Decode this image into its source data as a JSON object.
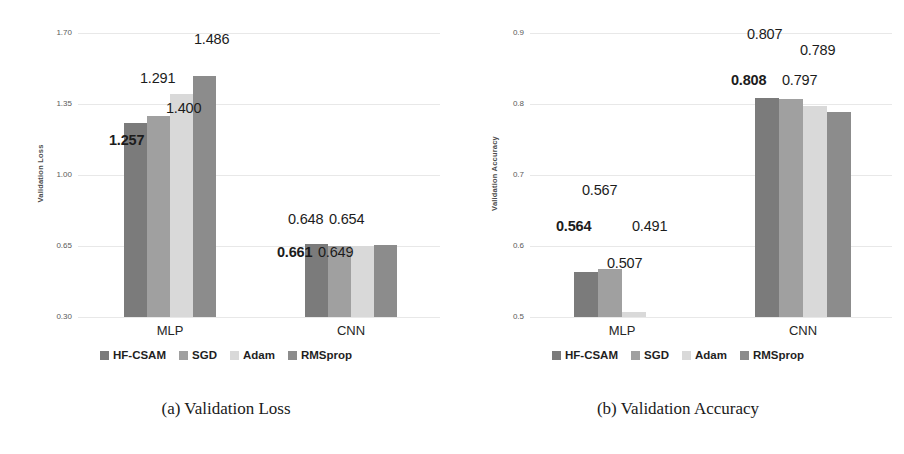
{
  "figure": {
    "series_colors": [
      "#7b7b7b",
      "#a0a0a0",
      "#d9d9d9",
      "#8c8c8c"
    ],
    "legend": [
      {
        "label": "HF-CSAM",
        "color": "#7b7b7b",
        "swatch_name": "legend-swatch-hf-csam"
      },
      {
        "label": "SGD",
        "color": "#a0a0a0",
        "swatch_name": "legend-swatch-sgd"
      },
      {
        "label": "Adam",
        "color": "#d9d9d9",
        "swatch_name": "legend-swatch-adam"
      },
      {
        "label": "RMSprop",
        "color": "#8c8c8c",
        "swatch_name": "legend-swatch-rmsprop"
      }
    ]
  },
  "panel_a": {
    "caption": "(a) Validation Loss",
    "chart_data": {
      "type": "bar",
      "title": "",
      "xlabel": "",
      "ylabel": "Validation Loss",
      "ylim": [
        0.3,
        1.7
      ],
      "yticks": [
        "0.30",
        "0.65",
        "1.00",
        "1.35",
        "1.70"
      ],
      "ytick_values": [
        0.3,
        0.65,
        1.0,
        1.35,
        1.7
      ],
      "grid": true,
      "legend_position": "bottom",
      "categories": [
        "MLP",
        "CNN"
      ],
      "series": [
        {
          "name": "HF-CSAM",
          "values": [
            1.257,
            0.661
          ],
          "labels": [
            "1.257",
            "0.661"
          ]
        },
        {
          "name": "SGD",
          "values": [
            1.291,
            0.648
          ],
          "labels": [
            "1.291",
            "0.648"
          ]
        },
        {
          "name": "Adam",
          "values": [
            1.4,
            0.649
          ],
          "labels": [
            "1.400",
            "0.649"
          ]
        },
        {
          "name": "RMSprop",
          "values": [
            1.486,
            0.654
          ],
          "labels": [
            "1.486",
            "0.654"
          ]
        }
      ]
    }
  },
  "panel_b": {
    "caption": "(b) Validation Accuracy",
    "chart_data": {
      "type": "bar",
      "title": "",
      "xlabel": "",
      "ylabel": "Validation Accuracy",
      "ylim": [
        0.5,
        0.9
      ],
      "yticks": [
        "0.5",
        "0.6",
        "0.7",
        "0.8",
        "0.9"
      ],
      "ytick_values": [
        0.5,
        0.6,
        0.7,
        0.8,
        0.9
      ],
      "grid": true,
      "legend_position": "bottom",
      "categories": [
        "MLP",
        "CNN"
      ],
      "series": [
        {
          "name": "HF-CSAM",
          "values": [
            0.564,
            0.808
          ],
          "labels": [
            "0.564",
            "0.808"
          ]
        },
        {
          "name": "SGD",
          "values": [
            0.567,
            0.807
          ],
          "labels": [
            "0.567",
            "0.807"
          ]
        },
        {
          "name": "Adam",
          "values": [
            0.507,
            0.797
          ],
          "labels": [
            "0.507",
            "0.797"
          ]
        },
        {
          "name": "RMSprop",
          "values": [
            0.491,
            0.789
          ],
          "labels": [
            "0.491",
            "0.789"
          ]
        }
      ]
    }
  }
}
